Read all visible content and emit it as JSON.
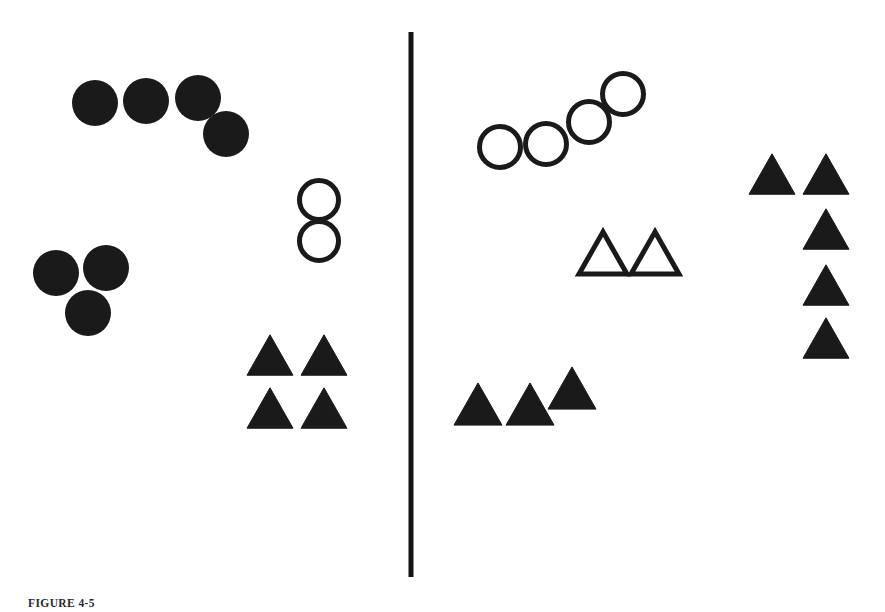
{
  "figure": {
    "background_color": "#ffffff",
    "ink_color": "#1a1a1a",
    "width": 885,
    "height": 612,
    "caption_label": "FIGURE 4-5",
    "caption_text": ""
  },
  "divider": {
    "name": "vertical-divider-line",
    "x": 411,
    "y_top": 32,
    "y_bottom": 577,
    "thickness": 5,
    "color": "#141414"
  },
  "panels": [
    {
      "id": "left-panel",
      "label": "Left panel",
      "x_range": [
        0,
        411
      ]
    },
    {
      "id": "right-panel",
      "label": "Right panel",
      "x_range": [
        411,
        885
      ]
    }
  ],
  "chart_data": {
    "type": "scatter",
    "xlabel": "",
    "ylabel": "",
    "xlim": [
      0,
      885
    ],
    "ylim": [
      612,
      0
    ],
    "grid": false,
    "legend": "none",
    "annotations": [
      {
        "name": "vertical-divider",
        "type": "line",
        "x": 411,
        "y0": 32,
        "y1": 577
      }
    ],
    "series": [
      {
        "name": "filled-circles-left-upper",
        "panel": "left-panel",
        "marker": "circle",
        "fill": "solid",
        "color": "#1a1a1a",
        "radius": 23,
        "count": 4,
        "points": [
          {
            "x": 95,
            "y": 103
          },
          {
            "x": 146,
            "y": 101
          },
          {
            "x": 198,
            "y": 98
          },
          {
            "x": 226,
            "y": 134
          }
        ]
      },
      {
        "name": "filled-circles-left-lower",
        "panel": "left-panel",
        "marker": "circle",
        "fill": "solid",
        "color": "#1a1a1a",
        "radius": 23,
        "count": 3,
        "points": [
          {
            "x": 56,
            "y": 273
          },
          {
            "x": 106,
            "y": 268
          },
          {
            "x": 88,
            "y": 313
          }
        ]
      },
      {
        "name": "open-circles-left",
        "panel": "left-panel",
        "marker": "circle",
        "fill": "open",
        "color": "#1a1a1a",
        "radius": 22,
        "stroke_width": 5,
        "count": 2,
        "points": [
          {
            "x": 319,
            "y": 200
          },
          {
            "x": 319,
            "y": 241
          }
        ]
      },
      {
        "name": "filled-triangles-left",
        "panel": "left-panel",
        "marker": "triangle",
        "fill": "solid",
        "color": "#1a1a1a",
        "size": 46,
        "count": 4,
        "points": [
          {
            "x": 270,
            "y": 355
          },
          {
            "x": 324,
            "y": 355
          },
          {
            "x": 270,
            "y": 408
          },
          {
            "x": 324,
            "y": 408
          }
        ]
      },
      {
        "name": "open-circles-right",
        "panel": "right-panel",
        "marker": "circle",
        "fill": "open",
        "color": "#1a1a1a",
        "radius": 23,
        "stroke_width": 5,
        "count": 4,
        "points": [
          {
            "x": 500,
            "y": 147
          },
          {
            "x": 546,
            "y": 144
          },
          {
            "x": 589,
            "y": 122
          },
          {
            "x": 623,
            "y": 94
          }
        ]
      },
      {
        "name": "open-triangles-right",
        "panel": "right-panel",
        "marker": "triangle",
        "fill": "open",
        "color": "#1a1a1a",
        "size": 48,
        "stroke_width": 5,
        "count": 2,
        "points": [
          {
            "x": 603,
            "y": 253
          },
          {
            "x": 655,
            "y": 253
          }
        ]
      },
      {
        "name": "filled-triangles-right-lower",
        "panel": "right-panel",
        "marker": "triangle",
        "fill": "solid",
        "color": "#1a1a1a",
        "size": 48,
        "count": 3,
        "points": [
          {
            "x": 478,
            "y": 404
          },
          {
            "x": 530,
            "y": 404
          },
          {
            "x": 572,
            "y": 388
          }
        ]
      },
      {
        "name": "filled-triangles-right-column",
        "panel": "right-panel",
        "marker": "triangle",
        "fill": "solid",
        "color": "#1a1a1a",
        "size": 46,
        "count": 5,
        "points": [
          {
            "x": 772,
            "y": 174
          },
          {
            "x": 826,
            "y": 174
          },
          {
            "x": 826,
            "y": 229
          },
          {
            "x": 826,
            "y": 285
          },
          {
            "x": 826,
            "y": 338
          }
        ]
      }
    ]
  }
}
